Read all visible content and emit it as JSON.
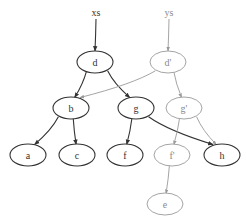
{
  "diagram": {
    "roots": [
      {
        "id": "xs",
        "label": "xs",
        "x": 96,
        "y": 12,
        "style": "old"
      },
      {
        "id": "ys",
        "label": "ys",
        "x": 169,
        "y": 12,
        "style": "new"
      }
    ],
    "nodes": [
      {
        "id": "d",
        "label": "d",
        "x": 95,
        "y": 62,
        "style": "old"
      },
      {
        "id": "d2",
        "label": "d'",
        "x": 168,
        "y": 62,
        "style": "new"
      },
      {
        "id": "b",
        "label": "b",
        "x": 71,
        "y": 108,
        "style": "old"
      },
      {
        "id": "g",
        "label": "g",
        "x": 136,
        "y": 108,
        "style": "old"
      },
      {
        "id": "g2",
        "label": "g'",
        "x": 184,
        "y": 108,
        "style": "new"
      },
      {
        "id": "a",
        "label": "a",
        "x": 28,
        "y": 155,
        "style": "old"
      },
      {
        "id": "c",
        "label": "c",
        "x": 77,
        "y": 155,
        "style": "old"
      },
      {
        "id": "f",
        "label": "f",
        "x": 125,
        "y": 155,
        "style": "old"
      },
      {
        "id": "f2",
        "label": "f'",
        "x": 172,
        "y": 155,
        "style": "new"
      },
      {
        "id": "h",
        "label": "h",
        "x": 222,
        "y": 155,
        "style": "old"
      },
      {
        "id": "e",
        "label": "e",
        "x": 165,
        "y": 204,
        "style": "new"
      }
    ],
    "edges": [
      {
        "from": "xs",
        "to": "d",
        "style": "old"
      },
      {
        "from": "ys",
        "to": "d2",
        "style": "new"
      },
      {
        "from": "d",
        "to": "b",
        "style": "old"
      },
      {
        "from": "d",
        "to": "g",
        "style": "old"
      },
      {
        "from": "d2",
        "to": "b",
        "style": "new"
      },
      {
        "from": "d2",
        "to": "g2",
        "style": "new"
      },
      {
        "from": "b",
        "to": "a",
        "style": "old"
      },
      {
        "from": "b",
        "to": "c",
        "style": "old"
      },
      {
        "from": "g",
        "to": "f",
        "style": "old"
      },
      {
        "from": "g",
        "to": "h",
        "style": "old"
      },
      {
        "from": "g2",
        "to": "f2",
        "style": "new"
      },
      {
        "from": "g2",
        "to": "h",
        "style": "new"
      },
      {
        "from": "f2",
        "to": "e",
        "style": "new"
      }
    ],
    "colors": {
      "old": "#333333",
      "new": "#9a9a9a"
    }
  }
}
